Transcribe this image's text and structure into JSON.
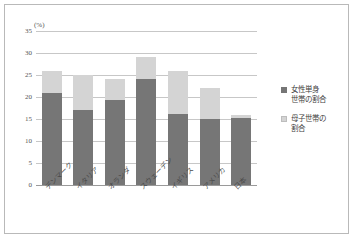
{
  "chart_data": {
    "type": "bar",
    "title": "",
    "subtitle": "",
    "xlabel": "",
    "ylabel": "(%)",
    "unit_label": "(%)",
    "stacked": true,
    "grid": true,
    "legend_position": "right",
    "ylim": [
      0,
      35
    ],
    "yticks": [
      0,
      5,
      10,
      15,
      20,
      25,
      30,
      35
    ],
    "ytick_labels": [
      "0",
      "5",
      "10",
      "15",
      "20",
      "25",
      "30",
      "35"
    ],
    "categories": [
      "デンマーク",
      "イタリア",
      "オランダ",
      "スウェーデン",
      "イギリス",
      "アメリカ",
      "日本"
    ],
    "series": [
      {
        "name": "女性単身世帯の割合",
        "color": "#767676",
        "values": [
          21.0,
          17.0,
          19.3,
          24.0,
          16.1,
          15.0,
          15.3
        ]
      },
      {
        "name": "母子世帯の割合",
        "color": "#d4d4d4",
        "values": [
          5.0,
          8.0,
          4.7,
          5.0,
          9.9,
          7.0,
          0.7
        ]
      }
    ],
    "totals": [
      26.0,
      25.0,
      24.0,
      29.0,
      26.0,
      22.0,
      16.0
    ]
  },
  "legend": {
    "items": [
      {
        "label_line1": "女性単身",
        "label_line2": "世帯の割合",
        "swatch": "dark-swatch"
      },
      {
        "label_line1": "母子世帯の",
        "label_line2": "割合",
        "swatch": "light-swatch"
      }
    ]
  }
}
